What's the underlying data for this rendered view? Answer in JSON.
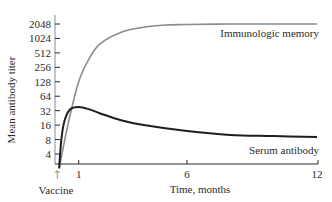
{
  "chart_data": {
    "type": "line",
    "title": "",
    "xlabel": "Time, months",
    "ylabel": "Mean antibody titer",
    "yscale": "log2",
    "y_ticks": [
      4,
      8,
      16,
      32,
      64,
      128,
      256,
      512,
      1024,
      2048
    ],
    "y_tick_labels": [
      "4",
      "8",
      "16",
      "32",
      "64",
      "128",
      "256",
      "512",
      "1024",
      "2048"
    ],
    "x_ticks": [
      1,
      6,
      12
    ],
    "x_tick_labels": [
      "1",
      "6",
      "12"
    ],
    "xlim": [
      0,
      12
    ],
    "ylim": [
      2,
      2048
    ],
    "grid": false,
    "legend": "none (direct labels)",
    "annotations": [
      {
        "text": "Vaccine",
        "x": 0,
        "marker": "up-arrow"
      },
      {
        "text": "Immunologic memory",
        "series": "Immunologic memory"
      },
      {
        "text": "Serum antibody",
        "series": "Serum antibody"
      }
    ],
    "series": [
      {
        "name": "Immunologic memory",
        "color": "#8c8c8c",
        "x": [
          0.1,
          0.5,
          1,
          1.5,
          2,
          3,
          4,
          5,
          6,
          8,
          10,
          12
        ],
        "values": [
          2,
          16,
          128,
          400,
          800,
          1400,
          1750,
          1950,
          2000,
          2048,
          2048,
          2048
        ]
      },
      {
        "name": "Serum antibody",
        "color": "#1e1e1e",
        "x": [
          0.1,
          0.2,
          0.35,
          0.6,
          1,
          1.5,
          2,
          3,
          4,
          6,
          8,
          10,
          12
        ],
        "values": [
          2,
          8,
          20,
          34,
          38,
          34,
          28,
          20,
          16,
          12,
          10,
          9.5,
          9
        ]
      }
    ]
  },
  "labels": {
    "ylabel": "Mean antibody titer",
    "xlabel": "Time, months",
    "vaccine": "Vaccine",
    "vaccine_arrow": "↑",
    "memory": "Immunologic memory",
    "serum": "Serum antibody"
  }
}
